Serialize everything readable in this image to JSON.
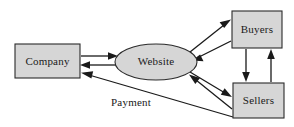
{
  "diagram": {
    "style": {
      "node_fill": "#d6d6d6",
      "node_stroke": "#2b2b2b",
      "edge_stroke": "#1a1a1a",
      "text_color": "#1a1a1a",
      "background": "#ffffff"
    },
    "nodes": [
      {
        "id": "company",
        "label": "Company",
        "shape": "rectangle",
        "x": 15,
        "y": 44,
        "width": 65,
        "height": 34,
        "cx": 47.5,
        "cy": 61
      },
      {
        "id": "website",
        "label": "Website",
        "shape": "ellipse",
        "cx": 156,
        "cy": 62,
        "rx": 41,
        "ry": 18
      },
      {
        "id": "buyers",
        "label": "Buyers",
        "shape": "rectangle",
        "x": 232,
        "y": 11,
        "width": 50,
        "height": 37,
        "cx": 257,
        "cy": 29.5
      },
      {
        "id": "sellers",
        "label": "Sellers",
        "shape": "rectangle",
        "x": 233,
        "y": 83,
        "width": 51,
        "height": 35,
        "cx": 258.5,
        "cy": 100.5
      }
    ],
    "edges": [
      {
        "id": "company-to-website",
        "from": "company",
        "to": "website",
        "direction": "forward",
        "label": ""
      },
      {
        "id": "website-to-company",
        "from": "website",
        "to": "company",
        "direction": "forward",
        "label": ""
      },
      {
        "id": "website-to-buyers",
        "from": "website",
        "to": "buyers",
        "direction": "forward",
        "label": ""
      },
      {
        "id": "buyers-to-website",
        "from": "buyers",
        "to": "website",
        "direction": "forward",
        "label": ""
      },
      {
        "id": "website-to-sellers",
        "from": "website",
        "to": "sellers",
        "direction": "forward",
        "label": ""
      },
      {
        "id": "sellers-to-website",
        "from": "sellers",
        "to": "website",
        "direction": "forward",
        "label": ""
      },
      {
        "id": "buyers-to-sellers",
        "from": "buyers",
        "to": "sellers",
        "direction": "forward",
        "label": ""
      },
      {
        "id": "sellers-to-buyers",
        "from": "sellers",
        "to": "buyers",
        "direction": "forward",
        "label": ""
      },
      {
        "id": "sellers-to-company-payment",
        "from": "sellers",
        "to": "company",
        "direction": "forward",
        "label": "Payment"
      }
    ],
    "labels": {
      "company": "Company",
      "website": "Website",
      "buyers": "Buyers",
      "sellers": "Sellers",
      "payment": "Payment"
    }
  }
}
